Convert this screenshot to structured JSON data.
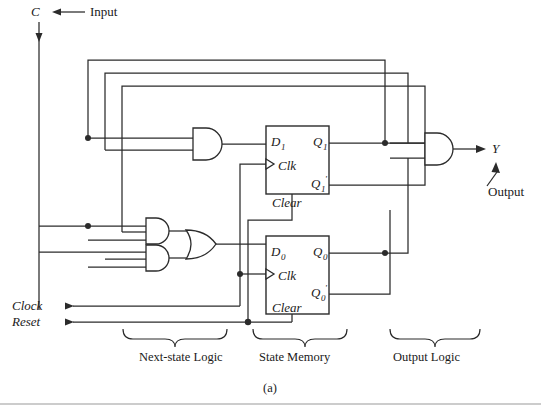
{
  "figure": {
    "caption": "(a)",
    "title_labels": {
      "input_signal": "C",
      "input_word": "Input",
      "output_signal": "Y",
      "output_word": "Output",
      "clock": "Clock",
      "reset": "Reset"
    },
    "sections": [
      {
        "name": "next-state-logic",
        "label": "Next-state Logic"
      },
      {
        "name": "state-memory",
        "label": "State Memory"
      },
      {
        "name": "output-logic",
        "label": "Output Logic"
      }
    ],
    "flipflops": [
      {
        "name": "flipflop-1",
        "d": "D",
        "d_sub": "1",
        "q": "Q",
        "q_sub": "1",
        "qn": "Q",
        "qn_sub": "1",
        "qn_prime": "'",
        "clk": "Clk",
        "clear": "Clear"
      },
      {
        "name": "flipflop-0",
        "d": "D",
        "d_sub": "0",
        "q": "Q",
        "q_sub": "0",
        "qn": "Q",
        "qn_sub": "0",
        "qn_prime": "'",
        "clk": "Clk",
        "clear": "Clear"
      }
    ],
    "gates": [
      {
        "name": "and-gate-d1",
        "type": "AND",
        "inputs": 2
      },
      {
        "name": "and-gate-upper-d0",
        "type": "AND",
        "inputs": 3
      },
      {
        "name": "and-gate-lower-d0",
        "type": "AND",
        "inputs": 3
      },
      {
        "name": "or-gate-d0",
        "type": "OR",
        "inputs": 2
      },
      {
        "name": "and-gate-output-y",
        "type": "AND",
        "inputs": 2
      }
    ],
    "colors": {
      "wire": "#2b2b2b",
      "text": "#1a1a1a",
      "background": "#ffffff",
      "rule": "#9a9a9a"
    }
  }
}
